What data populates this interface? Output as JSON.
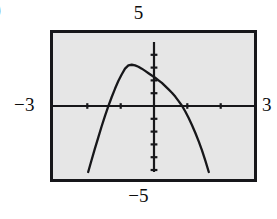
{
  "figure": {
    "corner_fragment": ")",
    "frame_color": "#17171a",
    "screen_color": "#e6e6e6",
    "curve_color": "#17171a"
  },
  "labels": {
    "y_max": "5",
    "y_min": "−5",
    "x_min": "−3",
    "x_max": "3"
  },
  "chart_data": {
    "type": "line",
    "title": "",
    "xlabel": "",
    "ylabel": "",
    "xlim": [
      -3,
      3
    ],
    "ylim": [
      -5,
      5
    ],
    "grid": false,
    "legend": null,
    "x_ticks": [
      -3,
      -2,
      -1,
      0,
      1,
      2,
      3
    ],
    "y_ticks": [
      -5,
      -4,
      -3,
      -2,
      -1,
      0,
      1,
      2,
      3,
      4,
      5
    ],
    "x_tick_labels": [
      "-3",
      "",
      "",
      "",
      "",
      "",
      "3"
    ],
    "y_tick_labels": [
      "-5",
      "",
      "",
      "",
      "",
      "",
      "",
      "",
      "",
      "",
      "5"
    ],
    "series": [
      {
        "name": "curve",
        "style": "solid",
        "x": [
          -1.95,
          -1.85,
          -1.75,
          -1.65,
          -1.55,
          -1.45,
          -1.35,
          -1.25,
          -1.15,
          -1.05,
          -0.95,
          -0.85,
          -0.75,
          -0.65,
          -0.55,
          -0.45,
          -0.35,
          -0.25,
          -0.15,
          -0.05,
          0.05,
          0.15,
          0.25,
          0.35,
          0.45,
          0.55,
          0.65,
          0.75,
          0.85,
          0.95,
          1.05,
          1.15,
          1.25,
          1.35,
          1.45,
          1.55,
          1.65
        ],
        "y": [
          -5.0,
          -4.1,
          -3.2,
          -2.35,
          -1.5,
          -0.7,
          0.05,
          0.75,
          1.4,
          2.0,
          2.5,
          2.95,
          3.2,
          3.25,
          3.2,
          3.1,
          2.95,
          2.78,
          2.6,
          2.42,
          2.25,
          2.05,
          1.85,
          1.6,
          1.35,
          1.1,
          0.8,
          0.45,
          0.1,
          -0.35,
          -0.85,
          -1.4,
          -2.0,
          -2.65,
          -3.35,
          -4.15,
          -5.0
        ]
      }
    ],
    "annotations": [
      {
        "text": "5",
        "position": "above-top-center"
      },
      {
        "text": "-5",
        "position": "below-bottom-center"
      },
      {
        "text": "-3",
        "position": "left-of-axis"
      },
      {
        "text": "3",
        "position": "right-of-axis"
      }
    ]
  }
}
